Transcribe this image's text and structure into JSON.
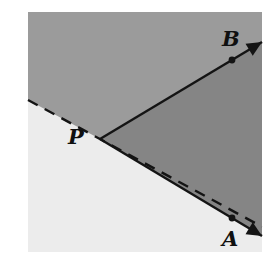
{
  "figure": {
    "name": "angle-bisector-ray-diagram",
    "width": 278,
    "height": 270,
    "background": "#ffffff"
  },
  "plane": {
    "name": "shaded-plane-rectangle",
    "x": 28,
    "y": 12,
    "width": 234,
    "height": 240,
    "regions": {
      "upper_half": {
        "label": "upper-half-plane",
        "color": "#9b9b9b"
      },
      "wedge": {
        "label": "intersection-wedge",
        "color": "#858585"
      },
      "lower_left": {
        "label": "lower-left-region",
        "color": "#ececec"
      }
    }
  },
  "points": [
    {
      "id": "P",
      "label": "P",
      "x": 100,
      "y": 139,
      "marker": false,
      "label_x": 68,
      "label_y": 126
    },
    {
      "id": "B",
      "label": "B",
      "x": 232,
      "y": 60,
      "marker": true,
      "label_x": 222,
      "label_y": 28
    },
    {
      "id": "A",
      "label": "A",
      "x": 232,
      "y": 218,
      "marker": true,
      "label_x": 222,
      "label_y": 228
    }
  ],
  "lines": [
    {
      "id": "ray-PB",
      "name": "solid-ray-to-B",
      "style": "solid",
      "color": "#141414",
      "width": 2.4,
      "from": [
        100,
        139
      ],
      "to": [
        263,
        43
      ],
      "arrow_end": true
    },
    {
      "id": "ray-PA",
      "name": "solid-ray-to-A",
      "style": "solid",
      "color": "#141414",
      "width": 2.4,
      "from": [
        100,
        139
      ],
      "to": [
        262,
        238
      ],
      "arrow_end": true
    },
    {
      "id": "line-dashed",
      "name": "dashed-line",
      "style": "dashed",
      "color": "#141414",
      "width": 2.4,
      "dash": "11 8",
      "from": [
        28,
        100
      ],
      "to": [
        28,
        180
      ],
      "through": [
        100,
        139
      ],
      "arrow_end": false
    }
  ],
  "marker": {
    "name": "point-dot",
    "radius": 3.4,
    "color": "#141414"
  },
  "arrowhead": {
    "name": "arrowhead",
    "length": 15,
    "halfwidth": 7,
    "color": "#141414"
  }
}
